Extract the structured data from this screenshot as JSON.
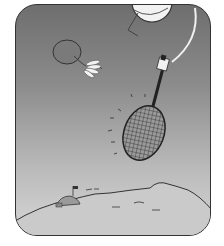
{
  "illustration": {
    "description": "Cartoon of a badminton racket on a string-like arm swinging at a shuttlecock above a hilly landscape with a small flag",
    "style": "grayscale",
    "colors": {
      "sky_top": "#6e6e6e",
      "sky_bottom": "#d6d6d6",
      "ground": "#c8c8c8",
      "outline": "#333333",
      "highlight": "#f2f2f2"
    },
    "elements": [
      {
        "name": "moon-ball",
        "label": "partial white ball at top"
      },
      {
        "name": "shuttlecock",
        "label": "shuttlecock with feather skirt"
      },
      {
        "name": "racket",
        "label": "badminton racket with cross-hatched strings"
      },
      {
        "name": "grip-hand",
        "label": "white grip at racket handle"
      },
      {
        "name": "swing-string",
        "label": "white curved line from grip to top"
      },
      {
        "name": "motion-marks",
        "label": "short dash marks around racket"
      },
      {
        "name": "hills",
        "label": "rolling hill horizon"
      },
      {
        "name": "flag",
        "label": "small flag on dome"
      }
    ]
  }
}
